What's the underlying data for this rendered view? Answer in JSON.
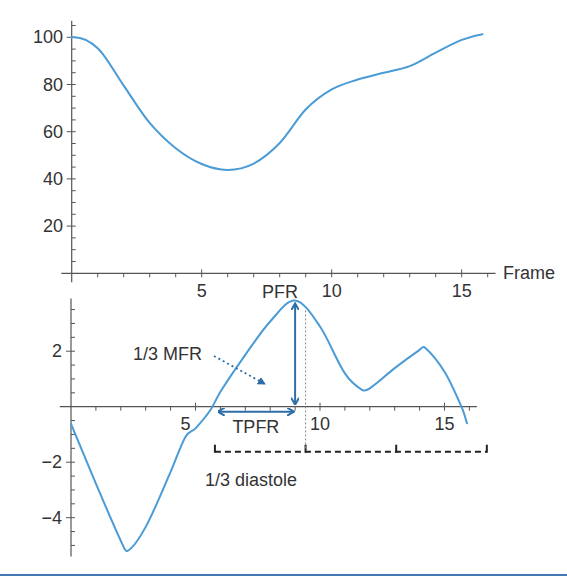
{
  "figure": {
    "bottom_rule_color": "#3f78b4"
  },
  "chart_data": [
    {
      "type": "line",
      "title": "",
      "xlabel": "Frame",
      "ylabel": "",
      "x": [
        0,
        1,
        2,
        3,
        4,
        5,
        6,
        7,
        8,
        9,
        10,
        11,
        12,
        13,
        14,
        15,
        15.8
      ],
      "series": [
        {
          "name": "volume",
          "values": [
            100,
            95.4,
            79.5,
            63.7,
            53,
            46.3,
            43.8,
            46.5,
            55.2,
            69.4,
            77.9,
            82.1,
            85,
            87.8,
            93.5,
            98.9,
            101.3
          ]
        }
      ],
      "xticks": [
        5,
        10,
        15
      ],
      "xtick_labels": [
        "5",
        "10",
        "15"
      ],
      "xminor_step": 1,
      "yticks": [
        20,
        40,
        60,
        80,
        100
      ],
      "ytick_labels": [
        "20",
        "40",
        "60",
        "80",
        "100"
      ],
      "yminor_step": 5,
      "xlim": [
        -0.4,
        16.3
      ],
      "ylim": [
        0,
        107
      ],
      "grid": false,
      "legend": "none",
      "line_color": "#4a9bd6",
      "axis_color": "#555555"
    },
    {
      "type": "line",
      "title": "",
      "xlabel": "",
      "ylabel": "",
      "x": [
        0,
        1,
        2,
        2.27,
        3,
        4,
        4.6,
        5,
        5.6,
        6,
        7,
        8,
        9,
        10,
        11,
        11.7,
        12,
        13,
        14,
        14.2,
        15,
        15.68,
        15.9
      ],
      "series": [
        {
          "name": "filling rate",
          "values": [
            -0.62,
            -2.77,
            -4.83,
            -5.2,
            -4.33,
            -2.35,
            -1.08,
            -0.78,
            -0.12,
            0.54,
            1.87,
            3.07,
            3.83,
            2.89,
            1.2,
            0.6,
            0.66,
            1.39,
            2.05,
            2.14,
            1.26,
            0,
            -0.6
          ]
        }
      ],
      "xticks": [
        5,
        10,
        15
      ],
      "xtick_labels": [
        "5",
        "10",
        "15"
      ],
      "xminor_step": 1,
      "yticks": [
        -4,
        -2,
        2
      ],
      "ytick_labels": [
        "−4",
        "−2",
        "2"
      ],
      "yminor_step": 0.5,
      "xlim": [
        -0.45,
        16.3
      ],
      "ylim": [
        -5.4,
        3.9
      ],
      "grid": false,
      "legend": "none",
      "line_color": "#4a9bd6",
      "axis_color": "#555555",
      "annotation_color": "#2d6ea8",
      "annotations": {
        "pfr": {
          "label": "PFR",
          "frame": 9.0,
          "value": 3.83
        },
        "tpfr": {
          "label": "TPFR",
          "from_frame": 5.85,
          "to_frame": 9.0
        },
        "mfr": {
          "label": "1/3 MFR"
        },
        "diastole": {
          "label": "1/3 diastole",
          "from_frame": 5.78,
          "to_frame": 16.7,
          "divisions": 3
        }
      }
    }
  ]
}
